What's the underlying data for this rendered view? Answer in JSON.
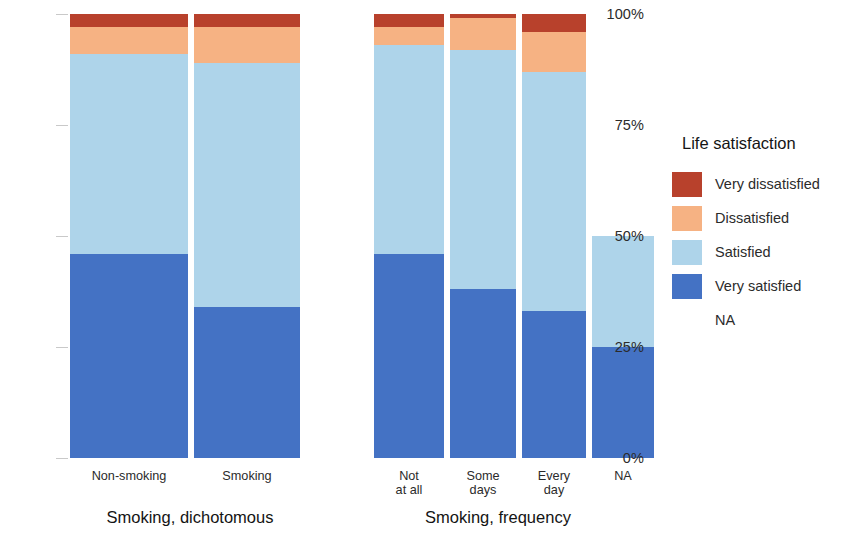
{
  "chart_data": {
    "type": "bar",
    "title": "",
    "subtitle": "",
    "xlabel": "",
    "ylabel": "",
    "stacked": true,
    "stack_mode": "percent",
    "orientation": "vertical",
    "grid": false,
    "ylim": [
      0,
      100
    ],
    "y_ticks": [
      "0%",
      "25%",
      "50%",
      "75%",
      "100%"
    ],
    "y_tick_values": [
      0,
      25,
      50,
      75,
      100
    ],
    "legend_title": "Life satisfaction",
    "legend_position": "right",
    "legend_entries": [
      {
        "label": "Very dissatisfied",
        "color": "#b8412c"
      },
      {
        "label": "Dissatisfied",
        "color": "#f6b283"
      },
      {
        "label": "Satisfied",
        "color": "#aed4ea"
      },
      {
        "label": "Very satisfied",
        "color": "#4472c4"
      },
      {
        "label": "NA",
        "color": "#ffffff"
      }
    ],
    "series": [
      {
        "name": "Very dissatisfied",
        "color": "#b8412c",
        "values": [
          3,
          3,
          3,
          1,
          4,
          0
        ]
      },
      {
        "name": "Dissatisfied",
        "color": "#f6b283",
        "values": [
          6,
          8,
          4,
          7,
          9,
          0
        ]
      },
      {
        "name": "Satisfied",
        "color": "#aed4ea",
        "values": [
          45,
          55,
          47,
          54,
          54,
          25
        ]
      },
      {
        "name": "Very satisfied",
        "color": "#4472c4",
        "values": [
          46,
          34,
          46,
          38,
          33,
          25
        ]
      },
      {
        "name": "NA",
        "color": "#ffffff",
        "values": [
          0,
          0,
          0,
          0,
          0,
          50
        ]
      }
    ],
    "panels": [
      {
        "title": "Smoking, dichotomous",
        "categories": [
          "Non-smoking",
          "Smoking"
        ],
        "bars": [
          {
            "label": "Non-smoking",
            "segments": [
              {
                "name": "Very dissatisfied",
                "value": 3,
                "color": "#b8412c"
              },
              {
                "name": "Dissatisfied",
                "value": 6,
                "color": "#f6b283"
              },
              {
                "name": "Satisfied",
                "value": 45,
                "color": "#aed4ea"
              },
              {
                "name": "Very satisfied",
                "value": 46,
                "color": "#4472c4"
              }
            ]
          },
          {
            "label": "Smoking",
            "segments": [
              {
                "name": "Very dissatisfied",
                "value": 3,
                "color": "#b8412c"
              },
              {
                "name": "Dissatisfied",
                "value": 8,
                "color": "#f6b283"
              },
              {
                "name": "Satisfied",
                "value": 55,
                "color": "#aed4ea"
              },
              {
                "name": "Very satisfied",
                "value": 34,
                "color": "#4472c4"
              }
            ]
          }
        ]
      },
      {
        "title": "Smoking, frequency",
        "categories": [
          "Not\nat all",
          "Some\ndays",
          "Every\nday",
          "NA"
        ],
        "bars": [
          {
            "label": "Not\nat all",
            "segments": [
              {
                "name": "Very dissatisfied",
                "value": 3,
                "color": "#b8412c"
              },
              {
                "name": "Dissatisfied",
                "value": 4,
                "color": "#f6b283"
              },
              {
                "name": "Satisfied",
                "value": 47,
                "color": "#aed4ea"
              },
              {
                "name": "Very satisfied",
                "value": 46,
                "color": "#4472c4"
              }
            ]
          },
          {
            "label": "Some\ndays",
            "segments": [
              {
                "name": "Very dissatisfied",
                "value": 1,
                "color": "#b8412c"
              },
              {
                "name": "Dissatisfied",
                "value": 7,
                "color": "#f6b283"
              },
              {
                "name": "Satisfied",
                "value": 54,
                "color": "#aed4ea"
              },
              {
                "name": "Very satisfied",
                "value": 38,
                "color": "#4472c4"
              }
            ]
          },
          {
            "label": "Every\nday",
            "segments": [
              {
                "name": "Very dissatisfied",
                "value": 4,
                "color": "#b8412c"
              },
              {
                "name": "Dissatisfied",
                "value": 9,
                "color": "#f6b283"
              },
              {
                "name": "Satisfied",
                "value": 54,
                "color": "#aed4ea"
              },
              {
                "name": "Very satisfied",
                "value": 33,
                "color": "#4472c4"
              }
            ]
          },
          {
            "label": "NA",
            "segments": [
              {
                "name": "NA",
                "value": 50,
                "color": "#ffffff"
              },
              {
                "name": "Satisfied",
                "value": 25,
                "color": "#aed4ea"
              },
              {
                "name": "Very satisfied",
                "value": 25,
                "color": "#4472c4"
              }
            ]
          }
        ]
      }
    ]
  },
  "legend": {
    "title": "Life satisfaction",
    "items": [
      {
        "label": "Very dissatisfied",
        "color": "#b8412c"
      },
      {
        "label": "Dissatisfied",
        "color": "#f6b283"
      },
      {
        "label": "Satisfied",
        "color": "#aed4ea"
      },
      {
        "label": "Very satisfied",
        "color": "#4472c4"
      },
      {
        "label": "NA",
        "color": "#ffffff"
      }
    ]
  },
  "axis": {
    "y_ticks": [
      "100%",
      "75%",
      "50%",
      "25%",
      "0%"
    ]
  },
  "panels": {
    "p0_title": "Smoking, dichotomous",
    "p1_title": "Smoking, frequency"
  }
}
